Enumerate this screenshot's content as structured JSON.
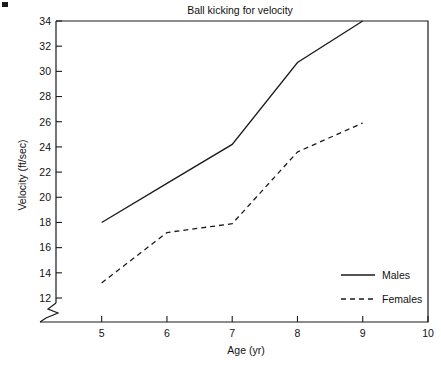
{
  "chart_data": {
    "type": "line",
    "title": "Ball kicking for velocity",
    "xlabel": "Age (yr)",
    "ylabel": "Velocity (ft/sec)",
    "x": [
      5,
      6,
      7,
      8,
      9
    ],
    "xlim": [
      4.3,
      10
    ],
    "ylim": [
      11.2,
      34
    ],
    "xticks": [
      5,
      6,
      7,
      8,
      9,
      10
    ],
    "xtick_labels": [
      "5",
      "6",
      "7",
      "8",
      "9",
      "10"
    ],
    "yticks": [
      12,
      14,
      16,
      18,
      20,
      22,
      24,
      26,
      28,
      30,
      32,
      34
    ],
    "ytick_labels": [
      "12",
      "14",
      "16",
      "18",
      "20",
      "22",
      "24",
      "26",
      "28",
      "30",
      "32",
      "34"
    ],
    "y_axis_break": true,
    "grid": false,
    "legend_position": "lower right",
    "series": [
      {
        "name": "Males",
        "style": "solid",
        "values": [
          18.0,
          21.1,
          24.2,
          30.7,
          34.0
        ]
      },
      {
        "name": "Females",
        "style": "dashed",
        "values": [
          13.2,
          17.2,
          17.9,
          23.6,
          25.9
        ]
      }
    ]
  },
  "legend": {
    "items": [
      {
        "label": "Males",
        "style": "solid"
      },
      {
        "label": "Females",
        "style": "dashed"
      }
    ]
  },
  "colors": {
    "ink": "#1a1a1a",
    "background": "#ffffff"
  }
}
